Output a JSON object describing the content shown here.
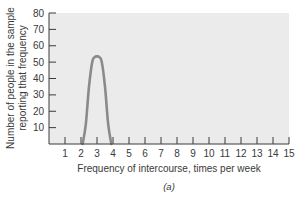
{
  "chart_data": {
    "type": "line",
    "title": "",
    "caption": "(a)",
    "xlabel": "Frequency of intercourse, times per week",
    "ylabel_lines": [
      "Number of people in the sample",
      "reporting that frequency"
    ],
    "xlim": [
      0,
      15
    ],
    "ylim": [
      0,
      80
    ],
    "x_ticks": [
      1,
      2,
      3,
      4,
      5,
      6,
      7,
      8,
      9,
      10,
      11,
      12,
      13,
      14,
      15
    ],
    "y_ticks": [
      10,
      20,
      30,
      40,
      50,
      60,
      70,
      80
    ],
    "grid": false,
    "legend": null,
    "series": [
      {
        "name": "distribution",
        "color": "#8a8a8a",
        "x": [
          2.1,
          2.3,
          2.5,
          2.7,
          2.85,
          3.0,
          3.15,
          3.3,
          3.5,
          3.7,
          3.9
        ],
        "y": [
          0,
          12,
          35,
          50,
          53,
          53.5,
          53,
          50,
          35,
          12,
          0
        ]
      }
    ],
    "colors": {
      "plot_background": "#ebebeb",
      "axis": "#3a3a3a",
      "curve": "#8a8a8a"
    }
  }
}
